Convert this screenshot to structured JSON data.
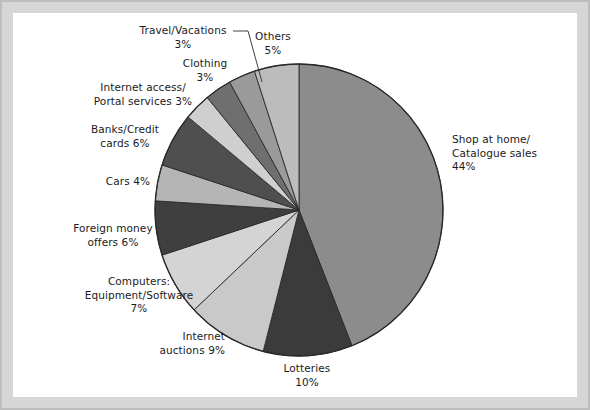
{
  "figure": {
    "background_color": "#ffffff",
    "border_color": "#d6d6d6"
  },
  "chart_data": {
    "type": "pie",
    "title": "",
    "subtitle": "",
    "xlabel": "",
    "ylabel": "",
    "legend_position": "none",
    "grid": false,
    "units": "percent",
    "start_angle_deg": 0,
    "direction": "clockwise",
    "total": 100,
    "categories": [
      "Shop at home/\nCatalogue sales",
      "Lotteries",
      "Internet\nauctions",
      "Computers:\nEquipment/Software",
      "Foreign money\noffers",
      "Cars",
      "Banks/Credit\ncards",
      "Internet access/\nPortal services",
      "Clothing",
      "Travel/Vacations",
      "Others"
    ],
    "values": [
      44,
      10,
      9,
      7,
      6,
      4,
      6,
      3,
      3,
      3,
      5
    ],
    "colors": [
      "#8c8c8c",
      "#3b3b3b",
      "#c9c9c9",
      "#d4d4d4",
      "#3f3f3f",
      "#b5b5b5",
      "#4f4f4f",
      "#cfcfcf",
      "#6f6f6f",
      "#9a9a9a",
      "#bcbcbc"
    ],
    "slices": [
      {
        "label": "Shop at home/\nCatalogue sales",
        "value": 44,
        "value_text": "44%",
        "color": "#8c8c8c"
      },
      {
        "label": "Lotteries",
        "value": 10,
        "value_text": "10%",
        "color": "#3b3b3b"
      },
      {
        "label": "Internet\nauctions",
        "value": 9,
        "value_text": "9%",
        "color": "#c9c9c9"
      },
      {
        "label": "Computers:\nEquipment/Software",
        "value": 7,
        "value_text": "7%",
        "color": "#d4d4d4"
      },
      {
        "label": "Foreign money\noffers",
        "value": 6,
        "value_text": "6%",
        "color": "#3f3f3f"
      },
      {
        "label": "Cars",
        "value": 4,
        "value_text": "4%",
        "color": "#b5b5b5"
      },
      {
        "label": "Banks/Credit\ncards",
        "value": 6,
        "value_text": "6%",
        "color": "#4f4f4f"
      },
      {
        "label": "Internet access/\nPortal services",
        "value": 3,
        "value_text": "3%",
        "color": "#cfcfcf"
      },
      {
        "label": "Clothing",
        "value": 3,
        "value_text": "3%",
        "color": "#6f6f6f"
      },
      {
        "label": "Travel/Vacations",
        "value": 3,
        "value_text": "3%",
        "color": "#9a9a9a"
      },
      {
        "label": "Others",
        "value": 5,
        "value_text": "5%",
        "color": "#bcbcbc"
      }
    ]
  },
  "labels": {
    "shop_at_home": "Shop at home/\nCatalogue sales\n44%",
    "lotteries": "Lotteries\n10%",
    "internet_auctions": "Internet\nauctions 9%",
    "computers": "Computers:\nEquipment/Software\n7%",
    "foreign_money": "Foreign money\noffers 6%",
    "cars": "Cars 4%",
    "banks_credit": "Banks/Credit\ncards 6%",
    "internet_access": "Internet access/\nPortal services 3%",
    "clothing": "Clothing\n3%",
    "travel_vacations": "Travel/Vacations\n3%",
    "others": "Others\n5%"
  }
}
